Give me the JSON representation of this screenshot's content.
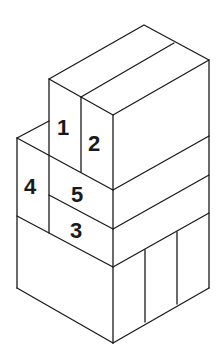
{
  "diagram": {
    "title": "",
    "type": "isometric-block-stack",
    "line_color": "#1a1a1a",
    "background": "#ffffff",
    "labels": [
      {
        "id": "1",
        "text": "1",
        "x": 64,
        "y": 135
      },
      {
        "id": "2",
        "text": "2",
        "x": 95,
        "y": 150
      },
      {
        "id": "4",
        "text": "4",
        "x": 32,
        "y": 194
      },
      {
        "id": "5",
        "text": "5",
        "x": 78,
        "y": 202
      },
      {
        "id": "3",
        "text": "3",
        "x": 77,
        "y": 238
      }
    ]
  }
}
